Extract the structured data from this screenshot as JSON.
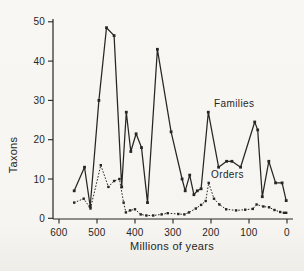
{
  "figure": {
    "background": "#f6f5f1",
    "ink": "#262626"
  },
  "chart_data": {
    "type": "line",
    "title": "",
    "xlabel": "Millions of years",
    "ylabel": "Taxons",
    "grid": false,
    "legend_position": "inline-annotations",
    "x_axis": {
      "min": 600,
      "max": 0,
      "reversed": true,
      "ticks": [
        600,
        500,
        400,
        300,
        200,
        100,
        0
      ]
    },
    "y_axis": {
      "min": 0,
      "max": 50,
      "ticks": [
        0,
        10,
        20,
        30,
        40,
        50
      ]
    },
    "series": [
      {
        "name": "Families",
        "line_style": "solid",
        "marker": "square",
        "color": "#262626",
        "points": [
          [
            560,
            7
          ],
          [
            533,
            13
          ],
          [
            518,
            3
          ],
          [
            495,
            30
          ],
          [
            475,
            48.5
          ],
          [
            455,
            46.5
          ],
          [
            435,
            8
          ],
          [
            423,
            27
          ],
          [
            411,
            17
          ],
          [
            397,
            21.5
          ],
          [
            383,
            18
          ],
          [
            367,
            4
          ],
          [
            341,
            43
          ],
          [
            305,
            22
          ],
          [
            276,
            10
          ],
          [
            268,
            7
          ],
          [
            256,
            11
          ],
          [
            245,
            6
          ],
          [
            236,
            7
          ],
          [
            226,
            7.5
          ],
          [
            207,
            27
          ],
          [
            180,
            13
          ],
          [
            159,
            14.5
          ],
          [
            145,
            14.5
          ],
          [
            122,
            13
          ],
          [
            85,
            24.5
          ],
          [
            77,
            22.5
          ],
          [
            65,
            5.5
          ],
          [
            48,
            14.5
          ],
          [
            30,
            9
          ],
          [
            13,
            9
          ],
          [
            2,
            4.5
          ]
        ]
      },
      {
        "name": "Orders",
        "line_style": "dotted",
        "marker": "square",
        "color": "#262626",
        "points": [
          [
            560,
            4
          ],
          [
            535,
            5
          ],
          [
            517,
            2.5
          ],
          [
            490,
            13.5
          ],
          [
            470,
            8
          ],
          [
            455,
            9.5
          ],
          [
            441,
            10
          ],
          [
            430,
            4
          ],
          [
            424,
            1.5
          ],
          [
            413,
            2
          ],
          [
            400,
            2.3
          ],
          [
            385,
            1
          ],
          [
            370,
            0.7
          ],
          [
            352,
            0.7
          ],
          [
            330,
            1
          ],
          [
            314,
            1.3
          ],
          [
            286,
            1.1
          ],
          [
            270,
            1
          ],
          [
            258,
            1.5
          ],
          [
            240,
            2.5
          ],
          [
            226,
            3.4
          ],
          [
            214,
            4.4
          ],
          [
            206,
            9
          ],
          [
            192,
            5
          ],
          [
            178,
            3.5
          ],
          [
            160,
            2.3
          ],
          [
            134,
            2
          ],
          [
            110,
            2.2
          ],
          [
            90,
            2.4
          ],
          [
            80,
            3.5
          ],
          [
            62,
            3
          ],
          [
            47,
            2.8
          ],
          [
            33,
            2.1
          ],
          [
            18,
            1.6
          ],
          [
            8,
            1.4
          ],
          [
            2,
            1.4
          ]
        ]
      }
    ],
    "annotations": [
      {
        "text": "Families",
        "x": 192,
        "y": 28.3,
        "anchor": "start"
      },
      {
        "text": "Orders",
        "x": 200,
        "y": 10.2,
        "anchor": "start"
      }
    ]
  }
}
